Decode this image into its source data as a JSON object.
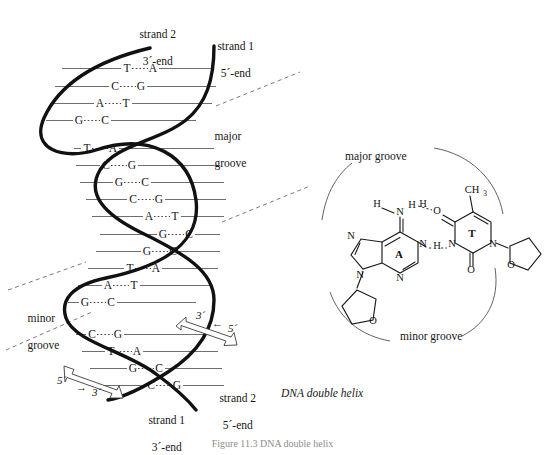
{
  "figure": {
    "title": "DNA double helix",
    "caption": "Figure 11.3   DNA double helix"
  },
  "helix": {
    "labels": {
      "strand2_top_line1": "strand 2",
      "strand2_top_line2": "3´-end",
      "strand1_top_line1": "strand 1",
      "strand1_top_line2": "5´-end",
      "strand1_bottom_line1": "strand 1",
      "strand1_bottom_line2": "3´-end",
      "strand2_bottom_line1": "strand 2",
      "strand2_bottom_line2": "5´-end",
      "major_groove_line1": "major",
      "major_groove_line2": "groove",
      "minor_groove_line1": "minor",
      "minor_groove_line2": "groove"
    },
    "arrows": [
      {
        "name": "upper-arrow",
        "start": "3´",
        "mid": "←",
        "end": "5´"
      },
      {
        "name": "lower-arrow",
        "start": "5´",
        "mid": "→",
        "end": "3´"
      }
    ],
    "base_pairs": [
      {
        "left": "T",
        "right": "A",
        "bonds": 2,
        "y": 72,
        "x1": 62,
        "x2": 212,
        "cx": 140
      },
      {
        "left": "C",
        "right": "G",
        "bonds": 3,
        "y": 90,
        "x1": 55,
        "x2": 216,
        "cx": 128
      },
      {
        "left": "A",
        "right": "T",
        "bonds": 2,
        "y": 107,
        "x1": 50,
        "x2": 212,
        "cx": 113
      },
      {
        "left": "G",
        "right": "C",
        "bonds": 3,
        "y": 124,
        "x1": 46,
        "x2": 196,
        "cx": 92
      },
      {
        "left": "T",
        "right": "A",
        "bonds": 2,
        "y": 152,
        "x1": 74,
        "x2": 214,
        "cx": 100
      },
      {
        "left": "C",
        "right": "G",
        "bonds": 3,
        "y": 169,
        "x1": 76,
        "x2": 220,
        "cx": 119
      },
      {
        "left": "G",
        "right": "C",
        "bonds": 3,
        "y": 186,
        "x1": 80,
        "x2": 224,
        "cx": 132
      },
      {
        "left": "C",
        "right": "G",
        "bonds": 3,
        "y": 203,
        "x1": 86,
        "x2": 226,
        "cx": 146
      },
      {
        "left": "A",
        "right": "T",
        "bonds": 2,
        "y": 220,
        "x1": 92,
        "x2": 224,
        "cx": 162
      },
      {
        "left": "G",
        "right": "C",
        "bonds": 3,
        "y": 238,
        "x1": 100,
        "x2": 220,
        "cx": 176
      },
      {
        "left": "G",
        "right": "C",
        "bonds": 3,
        "y": 255,
        "x1": 96,
        "x2": 220,
        "cx": 160
      },
      {
        "left": "T",
        "right": "A",
        "bonds": 3,
        "y": 272,
        "x1": 88,
        "x2": 218,
        "cx": 143
      },
      {
        "left": "A",
        "right": "T",
        "bonds": 2,
        "y": 289,
        "x1": 78,
        "x2": 212,
        "cx": 121
      },
      {
        "left": "G",
        "right": "C",
        "bonds": 2,
        "y": 306,
        "x1": 68,
        "x2": 196,
        "cx": 98
      },
      {
        "left": "C",
        "right": "G",
        "bonds": 2,
        "y": 338,
        "x1": 76,
        "x2": 212,
        "cx": 105
      },
      {
        "left": "T",
        "right": "A",
        "bonds": 3,
        "y": 355,
        "x1": 82,
        "x2": 218,
        "cx": 124
      },
      {
        "left": "G",
        "right": "C",
        "bonds": 4,
        "y": 372,
        "x1": 90,
        "x2": 222,
        "cx": 146
      },
      {
        "left": "C",
        "right": "G",
        "bonds": 4,
        "y": 389,
        "x1": 98,
        "x2": 224,
        "cx": 164
      }
    ]
  },
  "basepair_structure": {
    "title": "DNA double helix",
    "groove_labels": {
      "major": "major groove",
      "minor": "minor groove"
    },
    "adenine": {
      "label": "A",
      "atoms": [
        "H",
        "N",
        "H",
        "N",
        "N",
        "N",
        "N",
        "O"
      ]
    },
    "thymine": {
      "label": "T",
      "methyl": "CH",
      "methyl_sub": "3",
      "atoms": [
        "O",
        "N",
        "N",
        "O",
        "O"
      ]
    },
    "hydrogen_bond_labels": [
      "H",
      "H"
    ],
    "hydrogen_bond_count": 2
  }
}
